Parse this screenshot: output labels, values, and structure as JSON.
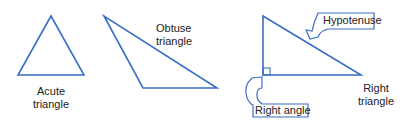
{
  "colors": {
    "stroke": "#3a6fc4",
    "text": "#222222",
    "background": "#ffffff"
  },
  "figures": [
    {
      "id": "acute",
      "label_line1": "Acute",
      "label_line2": "triangle"
    },
    {
      "id": "obtuse",
      "label_line1": "Obtuse",
      "label_line2": "triangle"
    },
    {
      "id": "right",
      "label_line1": "Right",
      "label_line2": "triangle",
      "callouts": {
        "hypotenuse": "Hypotenuse",
        "right_angle": "Right angle"
      }
    }
  ]
}
